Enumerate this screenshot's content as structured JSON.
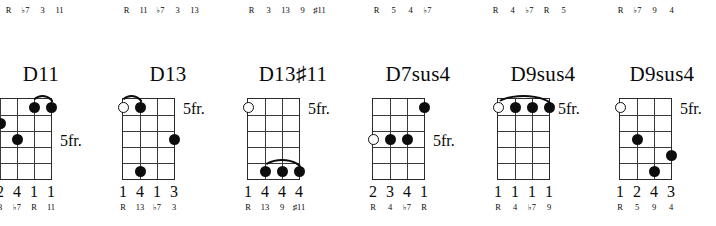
{
  "page": {
    "kind": "guitar-chord-diagram-chart",
    "fret_label_default": "5fr."
  },
  "clipped_top_row": {
    "note": "upper row of chord diagrams is cut off; only the finger-number and interval rows are visible",
    "groups": [
      {
        "fingers": [
          "2",
          "3",
          "4",
          "1"
        ],
        "intervals": [
          "R",
          "♭7",
          "3",
          "11"
        ]
      },
      {
        "fingers": [
          "1",
          "1",
          "1",
          "3",
          "4"
        ],
        "intervals": [
          "R",
          "11",
          "♭7",
          "3",
          "13"
        ]
      },
      {
        "fingers": [
          "2",
          "1",
          "1",
          "3",
          "1"
        ],
        "intervals": [
          "R",
          "3",
          "13",
          "9",
          "♯11"
        ]
      },
      {
        "fingers": [
          "1",
          "3",
          "4",
          "4"
        ],
        "intervals": [
          "R",
          "5",
          "4",
          "♭7"
        ]
      },
      {
        "fingers": [
          "2",
          "2",
          "3",
          "1",
          "4"
        ],
        "intervals": [
          "R",
          "4",
          "♭7",
          "R",
          "5"
        ]
      },
      {
        "fingers": [
          "2",
          "3",
          "4",
          "1"
        ],
        "intervals": [
          "R",
          "♭7",
          "9",
          "4"
        ]
      }
    ]
  },
  "chords": [
    {
      "name": "D11",
      "name_base": "D11",
      "strings": 5,
      "frets": 5,
      "fret_label": "5fr.",
      "clipped_left": true,
      "open_strings": [
        1
      ],
      "dots": [
        {
          "string": 4,
          "fret": 1
        },
        {
          "string": 5,
          "fret": 1
        },
        {
          "string": 2,
          "fret": 2
        },
        {
          "string": 3,
          "fret": 3
        }
      ],
      "barre": {
        "from_string": 4,
        "to_string": 5,
        "fret": 1
      },
      "fingers": [
        "3",
        "2",
        "4",
        "1",
        "1"
      ],
      "intervals": [
        "R",
        "3",
        "♭7",
        "R",
        "11"
      ]
    },
    {
      "name": "D13",
      "name_base": "D13",
      "strings": 4,
      "frets": 5,
      "fret_label": "5fr.",
      "clipped_left": false,
      "open_strings": [
        1
      ],
      "dots": [
        {
          "string": 2,
          "fret": 1
        },
        {
          "string": 4,
          "fret": 3
        },
        {
          "string": 2,
          "fret": 5
        }
      ],
      "barre": {
        "from_string": 1,
        "to_string": 2,
        "fret": 1
      },
      "fingers": [
        "1",
        "4",
        "1",
        "3"
      ],
      "intervals": [
        "R",
        "13",
        "♭7",
        "3"
      ]
    },
    {
      "name": "D13♯11",
      "name_base": "D13",
      "name_accidental": "♯",
      "name_suffix": "11",
      "strings": 4,
      "frets": 5,
      "fret_label": "5fr.",
      "clipped_left": false,
      "open_strings": [
        1
      ],
      "dots": [
        {
          "string": 2,
          "fret": 5
        },
        {
          "string": 3,
          "fret": 5
        },
        {
          "string": 4,
          "fret": 5
        }
      ],
      "barre": {
        "from_string": 2,
        "to_string": 4,
        "fret": 5
      },
      "fingers": [
        "1",
        "4",
        "4",
        "4"
      ],
      "intervals": [
        "R",
        "13",
        "9",
        "♯11"
      ]
    },
    {
      "name": "D7sus4",
      "name_base": "D7sus4",
      "strings": 4,
      "frets": 5,
      "fret_label": "5fr.",
      "clipped_left": false,
      "open_strings": [
        1
      ],
      "open_string_fret": 3,
      "dots": [
        {
          "string": 4,
          "fret": 1
        },
        {
          "string": 2,
          "fret": 3
        },
        {
          "string": 3,
          "fret": 3
        }
      ],
      "barre": null,
      "fingers": [
        "2",
        "3",
        "4",
        "1"
      ],
      "intervals": [
        "R",
        "4",
        "♭7",
        "R"
      ]
    },
    {
      "name": "D9sus4",
      "name_base": "D9sus4",
      "strings": 4,
      "frets": 5,
      "fret_label": "5fr.",
      "clipped_left": false,
      "open_strings": [
        1
      ],
      "dots": [
        {
          "string": 2,
          "fret": 1
        },
        {
          "string": 3,
          "fret": 1
        },
        {
          "string": 4,
          "fret": 1
        }
      ],
      "barre": {
        "from_string": 1,
        "to_string": 4,
        "fret": 1
      },
      "fingers": [
        "1",
        "1",
        "1",
        "1"
      ],
      "intervals": [
        "R",
        "4",
        "♭7",
        "9"
      ]
    },
    {
      "name": "D9sus4",
      "name_base": "D9sus4",
      "strings": 4,
      "frets": 5,
      "fret_label": "5fr.",
      "clipped_left": false,
      "open_strings": [
        1
      ],
      "dots": [
        {
          "string": 2,
          "fret": 3
        },
        {
          "string": 4,
          "fret": 4
        },
        {
          "string": 3,
          "fret": 5
        }
      ],
      "barre": null,
      "fingers": [
        "1",
        "2",
        "4",
        "3"
      ],
      "intervals": [
        "R",
        "5",
        "9",
        "4"
      ]
    }
  ]
}
